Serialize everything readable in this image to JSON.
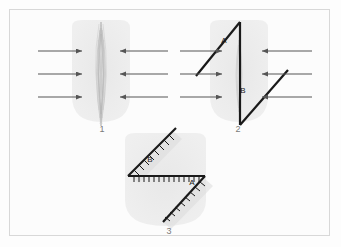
{
  "figure": {
    "background_color": "#fcfcfc",
    "frame_color": "#d8d8d8",
    "blob_color": "#ececec",
    "line_color": "#1a1a1a",
    "arrow_color": "#555555",
    "label_color": "#7a7a7a"
  },
  "panels": [
    {
      "id": "panel-1",
      "number": "1",
      "number_x": 102,
      "number_y": 125,
      "caption_labels": [],
      "arrows_left": [
        {
          "x1": 38,
          "y1": 51,
          "x2": 82,
          "y2": 51
        },
        {
          "x1": 38,
          "y1": 74,
          "x2": 82,
          "y2": 74
        },
        {
          "x1": 38,
          "y1": 97,
          "x2": 82,
          "y2": 97
        }
      ],
      "arrows_right": [
        {
          "x1": 168,
          "y1": 51,
          "x2": 120,
          "y2": 51
        },
        {
          "x1": 168,
          "y1": 74,
          "x2": 120,
          "y2": 74
        },
        {
          "x1": 168,
          "y1": 97,
          "x2": 120,
          "y2": 97
        }
      ]
    },
    {
      "id": "panel-2",
      "number": "2",
      "number_x": 238,
      "number_y": 125,
      "caption_labels": [
        {
          "text": "A",
          "x": 224,
          "y": 41
        },
        {
          "text": "B",
          "x": 243,
          "y": 91
        }
      ],
      "arrows_left": [
        {
          "x1": 180,
          "y1": 51,
          "x2": 222,
          "y2": 51
        },
        {
          "x1": 180,
          "y1": 74,
          "x2": 222,
          "y2": 74
        },
        {
          "x1": 180,
          "y1": 97,
          "x2": 222,
          "y2": 97
        }
      ],
      "arrows_right": [
        {
          "x1": 312,
          "y1": 51,
          "x2": 262,
          "y2": 51
        },
        {
          "x1": 312,
          "y1": 74,
          "x2": 262,
          "y2": 74
        },
        {
          "x1": 312,
          "y1": 97,
          "x2": 262,
          "y2": 97
        }
      ]
    },
    {
      "id": "panel-3",
      "number": "3",
      "number_x": 169,
      "number_y": 228,
      "caption_labels": [
        {
          "text": "B",
          "x": 150,
          "y": 160
        },
        {
          "text": "A",
          "x": 192,
          "y": 183
        }
      ],
      "arrows_left": [],
      "arrows_right": []
    }
  ],
  "accessibility": {
    "title": "Structural deformation diagram",
    "description": "Three numbered panels showing compression arrows, fold and fault geometry with labeled segments A and B."
  }
}
